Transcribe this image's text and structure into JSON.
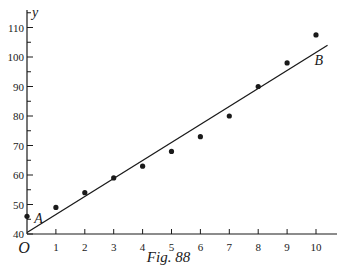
{
  "chart_data": {
    "type": "scatter",
    "title": "",
    "caption": "Fig. 88",
    "xlabel": "t",
    "ylabel": "y",
    "origin_label": "O",
    "xlim": [
      0,
      10.5
    ],
    "ylim": [
      40,
      113
    ],
    "x_ticks": [
      1,
      2,
      3,
      4,
      5,
      6,
      7,
      8,
      9,
      10
    ],
    "y_ticks": [
      40,
      50,
      60,
      70,
      80,
      90,
      100,
      110
    ],
    "y_minor_step": 5,
    "grid": false,
    "legend": null,
    "series": [
      {
        "name": "observations",
        "kind": "points",
        "x": [
          0,
          1,
          2,
          3,
          4,
          5,
          6,
          7,
          8,
          9,
          10
        ],
        "y": [
          46,
          49,
          54,
          59,
          63,
          68,
          73,
          80,
          90,
          98,
          107.5
        ]
      },
      {
        "name": "fitted line AB",
        "kind": "line",
        "x": [
          0,
          10.4
        ],
        "y": [
          40.5,
          104
        ]
      }
    ],
    "annotations": [
      {
        "text": "A",
        "x": 0.25,
        "y": 45.5
      },
      {
        "text": "B",
        "x": 9.95,
        "y": 99
      }
    ]
  }
}
